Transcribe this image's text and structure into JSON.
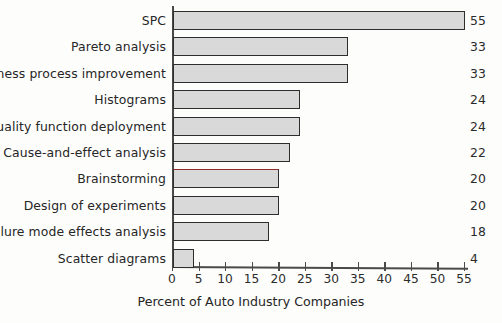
{
  "chart_data": {
    "type": "bar",
    "orientation": "horizontal",
    "title": "",
    "xlabel": "Percent of Auto Industry Companies",
    "ylabel": "",
    "xlim": [
      0,
      55
    ],
    "xticks": [
      0,
      5,
      10,
      15,
      20,
      25,
      30,
      35,
      40,
      45,
      50,
      55
    ],
    "grid": false,
    "legend": null,
    "categories": [
      "SPC",
      "Pareto analysis",
      "Business process improvement",
      "Histograms",
      "Quality function deployment",
      "Cause-and-effect analysis",
      "Brainstorming",
      "Design of experiments",
      "Failure mode effects analysis",
      "Scatter diagrams"
    ],
    "values": [
      55,
      33,
      33,
      24,
      24,
      22,
      20,
      20,
      18,
      4
    ],
    "value_labels": [
      "55",
      "33",
      "33",
      "24",
      "24",
      "22",
      "20",
      "20",
      "18",
      "4"
    ],
    "bars": [
      {
        "label": "SPC",
        "value": 55,
        "value_label": "55",
        "highlight": false
      },
      {
        "label": "Pareto analysis",
        "value": 33,
        "value_label": "33",
        "highlight": false
      },
      {
        "label": "Business process improvement",
        "value": 33,
        "value_label": "33",
        "highlight": false
      },
      {
        "label": "Histograms",
        "value": 24,
        "value_label": "24",
        "highlight": false
      },
      {
        "label": "Quality function deployment",
        "value": 24,
        "value_label": "24",
        "highlight": false
      },
      {
        "label": "Cause-and-effect analysis",
        "value": 22,
        "value_label": "22",
        "highlight": false
      },
      {
        "label": "Brainstorming",
        "value": 20,
        "value_label": "20",
        "highlight": true
      },
      {
        "label": "Design of experiments",
        "value": 20,
        "value_label": "20",
        "highlight": false
      },
      {
        "label": "Failure mode effects analysis",
        "value": 18,
        "value_label": "18",
        "highlight": false
      },
      {
        "label": "Scatter diagrams",
        "value": 4,
        "value_label": "4",
        "highlight": false
      }
    ],
    "colors": {
      "bar_fill": "#d9d9d9",
      "bar_border": "#2e2e2e",
      "highlight_border": "#8e2b2b",
      "axis": "#4a4a4a",
      "text": "#262626",
      "background": "#fdfdfc"
    }
  }
}
